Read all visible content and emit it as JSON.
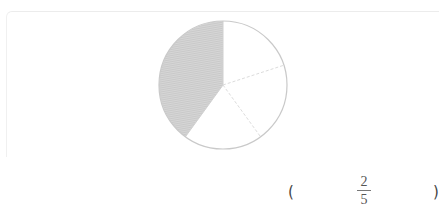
{
  "figure": {
    "type": "fraction-pie",
    "total_parts": 5,
    "shaded_parts": 2,
    "shade_color": "#c8c8c8",
    "outline_color": "#c9c9c9"
  },
  "answer": {
    "open_paren": "(",
    "numerator": "2",
    "denominator": "5",
    "close_paren": ")"
  }
}
